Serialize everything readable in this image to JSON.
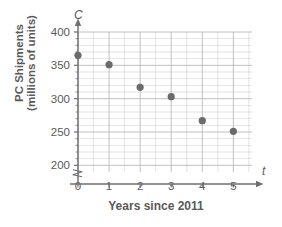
{
  "chart_data": {
    "type": "scatter",
    "title": "",
    "xlabel": "Years since 2011",
    "ylabel_line1": "PC Shipments",
    "ylabel_line2": "(millions of units)",
    "x_axis_variable": "t",
    "y_axis_variable": "C",
    "x": [
      0,
      1,
      2,
      3,
      4,
      5
    ],
    "values": [
      365,
      351,
      317,
      303,
      267,
      251
    ],
    "series": [
      {
        "name": "PC Shipments",
        "values": [
          365,
          351,
          317,
          303,
          267,
          251
        ]
      }
    ],
    "xlim": [
      0,
      5.6
    ],
    "ylim": [
      190,
      400
    ],
    "x_ticks": [
      "0",
      "1",
      "2",
      "3",
      "4",
      "5"
    ],
    "y_ticks": [
      "200",
      "250",
      "300",
      "350",
      "400"
    ],
    "y_tick_values": [
      200,
      250,
      300,
      350,
      400
    ],
    "y_minor_step": 10,
    "x_minor_step": 0.5,
    "grid": true,
    "legend": "none",
    "axis_break": true,
    "axis_break_location": "below-200-on-y-axis",
    "marker_color": "#6b6b6b",
    "grid_color": "#b9b9b9",
    "axis_color": "#6e6e6e",
    "text_color": "#5a5a5a"
  }
}
